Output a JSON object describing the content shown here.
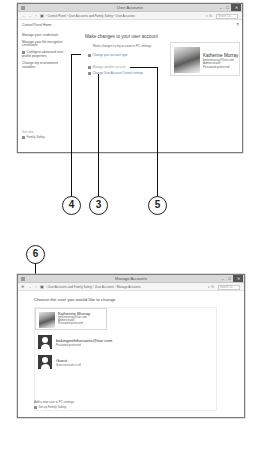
{
  "window1": {
    "title": "User Accounts",
    "controls": {
      "minimize": "–",
      "maximize": "□",
      "close": "✕"
    },
    "nav": {
      "back": "←",
      "forward": "→",
      "up": "↑"
    },
    "breadcrumbs": [
      "Control Panel",
      "User Accounts and Family Safety",
      "User Accounts"
    ],
    "breadcrumb_sep": "›",
    "search_placeholder": "Search Co...",
    "sidebar": {
      "home": "Control Panel Home",
      "items": [
        "Manage your credentials",
        "Manage your file encryption certificates",
        "Configure advanced user profile properties",
        "Change my environment variables"
      ],
      "see_also_label": "See also",
      "see_also_items": [
        "Family Safety"
      ]
    },
    "main": {
      "heading": "Make changes to your user account",
      "pc_settings_link": "Make changes to my account in PC settings",
      "links": [
        "Change your account type",
        "Manage another account",
        "Change User Account Control settings"
      ]
    },
    "account": {
      "name": "Katherine Murray",
      "email": "kmlistmurray@live.com",
      "role": "Administrator",
      "status": "Password protected"
    },
    "help": "?"
  },
  "callouts": {
    "c3": "3",
    "c4": "4",
    "c5": "5",
    "c6": "6"
  },
  "window2": {
    "title": "Manage Accounts",
    "controls": {
      "minimize": "–",
      "maximize": "□",
      "close": "✕"
    },
    "breadcrumbs": [
      "User Accounts and Family Safety",
      "User Accounts",
      "Manage Accounts"
    ],
    "breadcrumb_sep": "›",
    "search_placeholder": "Search Co...",
    "heading": "Choose the user you would like to change",
    "accounts": [
      {
        "name": "Katherine Murray",
        "line1": "kmlistmurray@live.com",
        "line2": "Administrator",
        "line3": "Password protected"
      },
      {
        "name": "bakingwiththesaints@live.com",
        "line1": "Password protected"
      },
      {
        "name": "Guest",
        "line1": "Guest account is off"
      }
    ],
    "add_user_link": "Add a new user in PC settings",
    "family_safety_link": "Set up Family Safety"
  }
}
